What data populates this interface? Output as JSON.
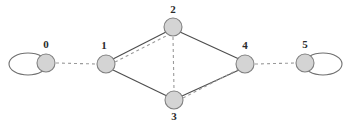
{
  "diagram": {
    "width": 349,
    "height": 128,
    "background_color": "#ffffff"
  },
  "style": {
    "node_fill": "#d4d4d4",
    "node_stroke": "#808080",
    "solid_edge_color": "#4d4d4d",
    "dashed_edge_color": "#9a9a9a",
    "label_color": "#2b2b2b",
    "node_radius": 9
  },
  "nodes": [
    {
      "id": "0",
      "label": "0",
      "cx": 46,
      "cy": 63,
      "label_x": 46,
      "label_y": 48
    },
    {
      "id": "1",
      "label": "1",
      "cx": 106,
      "cy": 64,
      "label_x": 104,
      "label_y": 49
    },
    {
      "id": "2",
      "label": "2",
      "cx": 173,
      "cy": 27,
      "label_x": 173,
      "label_y": 13
    },
    {
      "id": "3",
      "label": "3",
      "cx": 174,
      "cy": 100,
      "label_x": 174,
      "label_y": 120
    },
    {
      "id": "4",
      "label": "4",
      "cx": 245,
      "cy": 64,
      "label_x": 245,
      "label_y": 49
    },
    {
      "id": "5",
      "label": "5",
      "cx": 305,
      "cy": 63,
      "label_x": 305,
      "label_y": 48
    }
  ],
  "edges": [
    {
      "name": "edge-1-2-solid",
      "from": "1",
      "to": "2",
      "style": "solid",
      "x1": 113,
      "y1": 59,
      "x2": 166,
      "y2": 32
    },
    {
      "name": "edge-2-4-solid",
      "from": "2",
      "to": "4",
      "style": "solid",
      "x1": 180,
      "y1": 32,
      "x2": 239,
      "y2": 59
    },
    {
      "name": "edge-1-3-solid",
      "from": "1",
      "to": "3",
      "style": "solid",
      "x1": 113,
      "y1": 70,
      "x2": 167,
      "y2": 96
    },
    {
      "name": "edge-3-4-solid",
      "from": "3",
      "to": "4",
      "style": "solid",
      "x1": 182,
      "y1": 96,
      "x2": 239,
      "y2": 70
    },
    {
      "name": "edge-0-1-dashed",
      "from": "0",
      "to": "1",
      "style": "dashed",
      "x1": 56,
      "y1": 63,
      "x2": 96,
      "y2": 64
    },
    {
      "name": "edge-4-5-dashed",
      "from": "4",
      "to": "5",
      "style": "dashed",
      "x1": 255,
      "y1": 64,
      "x2": 295,
      "y2": 63
    },
    {
      "name": "edge-2-3-dashed",
      "from": "2",
      "to": "3",
      "style": "dashed",
      "x1": 173,
      "y1": 37,
      "x2": 174,
      "y2": 90
    },
    {
      "name": "edge-1-2-dashed",
      "from": "1",
      "to": "2",
      "style": "dashed",
      "x1": 115,
      "y1": 62,
      "x2": 168,
      "y2": 35
    },
    {
      "name": "edge-3-4-dashed",
      "from": "3",
      "to": "4",
      "style": "dashed",
      "x1": 183,
      "y1": 98,
      "x2": 241,
      "y2": 68
    }
  ],
  "self_loops": [
    {
      "name": "self-loop-node-0",
      "node": "0",
      "side": "left",
      "cx": 28,
      "cy": 64,
      "rx": 19,
      "ry": 11
    },
    {
      "name": "self-loop-node-5",
      "node": "5",
      "side": "right",
      "cx": 323,
      "cy": 64,
      "rx": 19,
      "ry": 11
    }
  ],
  "graph_data": {
    "type": "graph",
    "directed": false,
    "node_ids": [
      "0",
      "1",
      "2",
      "3",
      "4",
      "5"
    ],
    "solid_edges": [
      [
        "1",
        "2"
      ],
      [
        "2",
        "4"
      ],
      [
        "1",
        "3"
      ],
      [
        "3",
        "4"
      ]
    ],
    "dashed_edges": [
      [
        "0",
        "1"
      ],
      [
        "4",
        "5"
      ],
      [
        "2",
        "3"
      ],
      [
        "1",
        "2"
      ],
      [
        "3",
        "4"
      ]
    ],
    "self_loop_nodes": [
      "0",
      "5"
    ],
    "node_count": 6,
    "edge_count": 9,
    "self_loop_count": 2
  }
}
